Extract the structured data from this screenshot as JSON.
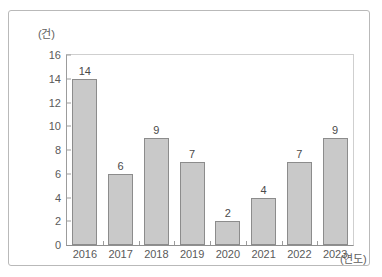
{
  "chart_data": {
    "type": "bar",
    "title": "",
    "subtitle": "",
    "xlabel": "(연도)",
    "ylabel": "(건)",
    "categories": [
      "2016",
      "2017",
      "2018",
      "2019",
      "2020",
      "2021",
      "2022",
      "2023"
    ],
    "values": [
      14,
      6,
      9,
      7,
      2,
      4,
      7,
      9
    ],
    "data_labels": [
      "14",
      "6",
      "9",
      "7",
      "2",
      "4",
      "7",
      "9"
    ],
    "ylim": [
      0,
      16
    ],
    "ytick_step": 2,
    "ytick_labels": [
      "16",
      "14",
      "12",
      "10",
      "8",
      "6",
      "4",
      "2",
      "0"
    ],
    "grid": false,
    "legend": null,
    "legend_position": "none",
    "colors": {
      "bar_fill": "#c9c9c9",
      "bar_border": "#8c8c8c",
      "axis": "#9c9c9c",
      "text": "#5a5a5a",
      "frame": "#b9b9b9",
      "background": "#ffffff"
    }
  }
}
